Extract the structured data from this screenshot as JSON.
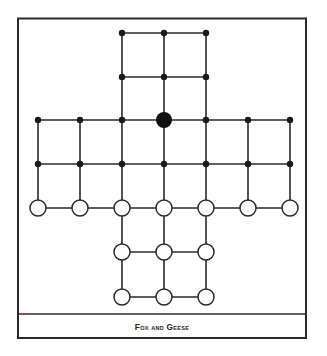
{
  "figure": {
    "title": "Fox and Geese",
    "colors": {
      "frame": "#2a2a2a",
      "lines": "#2a2a2a",
      "fox": "#111111",
      "goose_fill": "#ffffff",
      "goose_stroke": "#2a2a2a",
      "point": "#1a1a1a"
    }
  },
  "board": {
    "columns_x": [
      38,
      80,
      122,
      164,
      206,
      248,
      290
    ],
    "rows_y": [
      33,
      77,
      120,
      164,
      208,
      252,
      297
    ],
    "layout": "cross-shaped 33-point board",
    "fox": {
      "col": 3,
      "row": 2
    },
    "geese": [
      {
        "col": 0,
        "row": 4
      },
      {
        "col": 1,
        "row": 4
      },
      {
        "col": 2,
        "row": 4
      },
      {
        "col": 3,
        "row": 4
      },
      {
        "col": 4,
        "row": 4
      },
      {
        "col": 5,
        "row": 4
      },
      {
        "col": 6,
        "row": 4
      },
      {
        "col": 2,
        "row": 5
      },
      {
        "col": 3,
        "row": 5
      },
      {
        "col": 4,
        "row": 5
      },
      {
        "col": 2,
        "row": 6
      },
      {
        "col": 3,
        "row": 6
      },
      {
        "col": 4,
        "row": 6
      }
    ],
    "empty_points_count": 19,
    "geese_count": 13,
    "fox_count": 1
  }
}
